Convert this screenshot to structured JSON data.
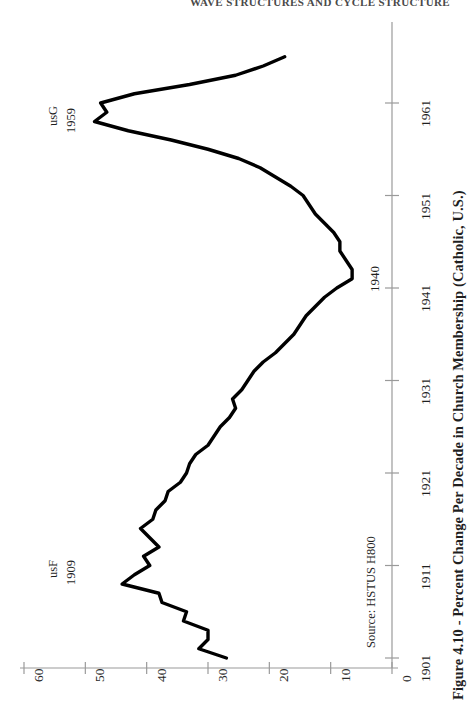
{
  "running_head": "WAVE STRUCTURES AND CYCLE STRUCTURE",
  "caption": "Figure 4.10 - Percent Change Per Decade in Church Membership (Catholic, U.S.)",
  "source_note": "Source: HSTUS H800",
  "annotations": [
    {
      "name": "peak-1940",
      "text": "1940"
    },
    {
      "name": "series-tag-usg",
      "line1": "usG",
      "line2": "1959"
    },
    {
      "name": "series-tag-usf",
      "line1": "usF",
      "line2": "1909"
    }
  ],
  "axes": {
    "value_axis": {
      "position": "bottom",
      "title": "",
      "ticks": [
        "60",
        "50",
        "40",
        "30",
        "20",
        "10",
        "0"
      ],
      "values": [
        60,
        50,
        40,
        30,
        20,
        10,
        0
      ],
      "reversed": true
    },
    "time_axis": {
      "position": "right",
      "title": "",
      "ticks": [
        "1961",
        "1951",
        "1941",
        "1931",
        "1921",
        "1911",
        "1901"
      ],
      "values": [
        1961,
        1951,
        1941,
        1931,
        1921,
        1911,
        1901
      ]
    }
  },
  "style": {
    "line_color": "#000000",
    "axis_color": "#9a9a9a",
    "background": "#ffffff",
    "line_width": 3.4
  },
  "chart_data": {
    "type": "line",
    "title": "Figure 4.10 - Percent Change Per Decade in Church Membership (Catholic, U.S.)",
    "subtitle": "",
    "orientation": "horizontal-value-vertical-time",
    "xlabel": "Percent Change Per Decade",
    "ylabel": "Year",
    "xlim": [
      60,
      0
    ],
    "ylim": [
      1901,
      1966
    ],
    "grid": false,
    "legend": null,
    "annotations": [
      {
        "label": "1940",
        "year": 1940,
        "value": 6.5
      },
      {
        "label": "usF 1909",
        "year": 1909,
        "value": 44.0
      },
      {
        "label": "usG 1959",
        "year": 1959,
        "value": 48.5
      }
    ],
    "series": [
      {
        "name": "Percent Change Per Decade in Church Membership (Catholic, U.S.)",
        "x": [
          1901,
          1902,
          1903,
          1904,
          1905,
          1906,
          1907,
          1908,
          1909,
          1910,
          1911,
          1912,
          1913,
          1914,
          1915,
          1916,
          1917,
          1918,
          1919,
          1920,
          1921,
          1922,
          1923,
          1924,
          1925,
          1926,
          1927,
          1928,
          1929,
          1930,
          1931,
          1932,
          1933,
          1934,
          1935,
          1936,
          1937,
          1938,
          1939,
          1940,
          1941,
          1942,
          1943,
          1944,
          1945,
          1946,
          1947,
          1948,
          1949,
          1950,
          1951,
          1952,
          1953,
          1954,
          1955,
          1956,
          1957,
          1958,
          1959,
          1960,
          1961,
          1962,
          1963,
          1964,
          1965,
          1966
        ],
        "y": [
          27.0,
          31.5,
          30.0,
          30.0,
          34.0,
          33.5,
          37.5,
          38.0,
          44.0,
          42.0,
          39.5,
          40.5,
          38.0,
          39.5,
          41.0,
          39.0,
          38.5,
          37.0,
          36.5,
          34.5,
          33.5,
          33.0,
          32.0,
          30.0,
          29.0,
          28.0,
          26.5,
          25.5,
          26.0,
          24.5,
          23.5,
          22.5,
          21.0,
          19.0,
          17.5,
          16.0,
          15.0,
          14.0,
          12.5,
          11.0,
          9.0,
          6.5,
          6.5,
          7.5,
          8.5,
          8.5,
          9.5,
          11.0,
          12.5,
          13.5,
          14.5,
          16.5,
          19.0,
          21.5,
          25.0,
          30.0,
          36.0,
          43.0,
          48.5,
          46.5,
          47.5,
          42.0,
          33.0,
          25.5,
          21.0,
          17.5
        ]
      }
    ]
  }
}
